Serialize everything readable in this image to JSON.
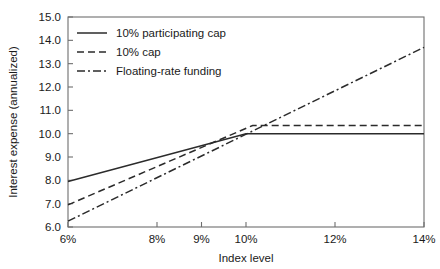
{
  "chart_data": {
    "type": "line",
    "title": "",
    "xlabel": "Index level",
    "ylabel": "Interest expense (annualized)",
    "xlim": [
      6,
      14
    ],
    "ylim": [
      6.0,
      15.0
    ],
    "grid": false,
    "legend_position": "top-left",
    "xticks": [
      6,
      8,
      9,
      10,
      12,
      14
    ],
    "xticklabels": [
      "6%",
      "8%",
      "9%",
      "10%",
      "12%",
      "14%"
    ],
    "yticks": [
      6.0,
      7.0,
      8.0,
      9.0,
      10.0,
      11.0,
      12.0,
      13.0,
      14.0,
      15.0
    ],
    "yticklabels": [
      "6.0",
      "7.0",
      "8.0",
      "9.0",
      "10.0",
      "11.0",
      "12.0",
      "13.0",
      "14.0",
      "15.0"
    ],
    "series": [
      {
        "name": "10% participating cap",
        "style": "solid",
        "points": [
          [
            6,
            7.95
          ],
          [
            10,
            10.0
          ],
          [
            14,
            10.0
          ]
        ]
      },
      {
        "name": "10% cap",
        "style": "dashed",
        "points": [
          [
            6,
            6.95
          ],
          [
            10.15,
            10.35
          ],
          [
            14,
            10.35
          ]
        ]
      },
      {
        "name": "Floating-rate funding",
        "style": "dashdot",
        "points": [
          [
            6,
            6.25
          ],
          [
            14,
            13.7
          ]
        ]
      }
    ]
  },
  "legend": {
    "items": [
      {
        "label": "10% participating cap",
        "style": "solid"
      },
      {
        "label": "10% cap",
        "style": "dashed"
      },
      {
        "label": "Floating-rate funding",
        "style": "dashdot"
      }
    ]
  },
  "axes": {
    "x_title": "Index level",
    "y_title": "Interest expense (annualized)"
  }
}
